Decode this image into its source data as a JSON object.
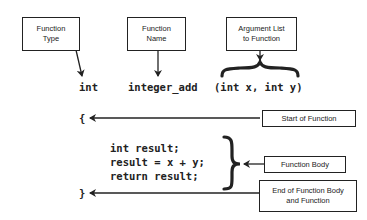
{
  "labels": {
    "function_type": "Function\nType",
    "function_name": "Function\nName",
    "argument_list": "Argument List\nto Function",
    "start_of_function": "Start of Function",
    "function_body": "Function Body",
    "end_of_function": "End of Function Body\nand Function"
  },
  "code": {
    "return_type": "int",
    "name": "integer_add",
    "params": "(int x, int y)",
    "open_brace": "{",
    "body_lines": [
      "int result;",
      "result = x + y;",
      "return result;"
    ],
    "close_brace": "}"
  },
  "colors": {
    "stroke": "#222222",
    "background": "#ffffff"
  }
}
